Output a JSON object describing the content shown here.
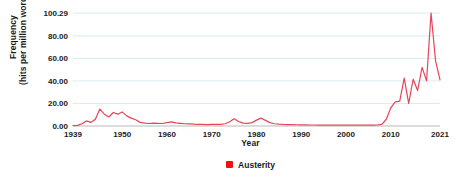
{
  "chart_data": {
    "type": "line",
    "title": "",
    "xlabel": "Year",
    "ylabel": "Frequency (hits per million words)",
    "ylabel_line1": "Frequency",
    "ylabel_line2": "(hits per million words)",
    "grid": true,
    "legend_position": "bottom-center",
    "xlim": [
      1939,
      2021
    ],
    "ylim": [
      0,
      100.29
    ],
    "yticks": [
      0,
      20,
      40,
      60,
      80,
      100.29
    ],
    "ytick_labels": [
      "0.00",
      "20.00",
      "40.00",
      "60.00",
      "80.00",
      "100.29"
    ],
    "xticks": [
      1939,
      1950,
      1960,
      1970,
      1980,
      1990,
      2000,
      2010,
      2021
    ],
    "xtick_labels": [
      "1939",
      "1950",
      "1960",
      "1970",
      "1980",
      "1990",
      "2000",
      "2010",
      "2021"
    ],
    "series": [
      {
        "name": "Austerity",
        "color": "#e8445a",
        "x": [
          1939,
          1940,
          1941,
          1942,
          1943,
          1944,
          1945,
          1946,
          1947,
          1948,
          1949,
          1950,
          1951,
          1952,
          1953,
          1954,
          1955,
          1956,
          1957,
          1958,
          1959,
          1960,
          1961,
          1962,
          1963,
          1964,
          1965,
          1966,
          1967,
          1968,
          1969,
          1970,
          1971,
          1972,
          1973,
          1974,
          1975,
          1976,
          1977,
          1978,
          1979,
          1980,
          1981,
          1982,
          1983,
          1984,
          1985,
          1986,
          1987,
          1988,
          1989,
          1990,
          1991,
          1992,
          1993,
          1994,
          1995,
          1996,
          1997,
          1998,
          1999,
          2000,
          2001,
          2002,
          2003,
          2004,
          2005,
          2006,
          2007,
          2008,
          2009,
          2010,
          2011,
          2012,
          2013,
          2014,
          2015,
          2016,
          2017,
          2018,
          2019,
          2020,
          2021
        ],
        "y": [
          0.4,
          0.6,
          2.0,
          4.5,
          3.2,
          6.0,
          15.0,
          10.5,
          8.0,
          12.0,
          10.5,
          12.5,
          9.0,
          7.0,
          5.5,
          3.2,
          2.6,
          2.2,
          2.6,
          2.4,
          2.2,
          3.0,
          3.6,
          2.8,
          2.4,
          2.0,
          1.8,
          1.6,
          1.5,
          1.4,
          1.3,
          1.4,
          1.4,
          1.5,
          2.0,
          3.8,
          6.5,
          4.0,
          2.6,
          2.4,
          3.0,
          5.2,
          7.0,
          5.0,
          3.0,
          2.0,
          1.6,
          1.4,
          1.3,
          1.2,
          1.1,
          1.0,
          1.0,
          0.9,
          0.9,
          0.8,
          0.8,
          0.8,
          0.8,
          0.7,
          0.7,
          0.7,
          0.7,
          0.7,
          0.7,
          0.7,
          0.8,
          0.8,
          0.9,
          1.5,
          6.0,
          16.0,
          21.5,
          22.0,
          42.5,
          20.0,
          41.5,
          31.5,
          52.0,
          40.0,
          100.29,
          58.0,
          41.0
        ]
      }
    ]
  },
  "legend": {
    "items": [
      {
        "label": "Austerity",
        "color": "#ee1111",
        "marker": "legend-square-marker"
      }
    ]
  },
  "axes": {
    "x_title": "Year",
    "y_title_line1": "Frequency",
    "y_title_line2": "(hits per million words)"
  }
}
